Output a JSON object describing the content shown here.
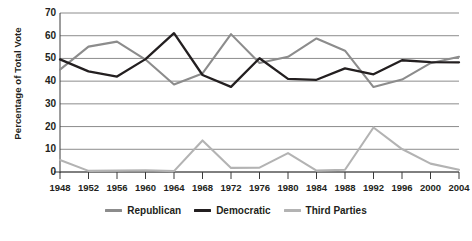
{
  "chart_data": {
    "type": "line",
    "title": "",
    "xlabel": "",
    "ylabel": "Percentage of Total Vote",
    "ylim": [
      0,
      70
    ],
    "yticks": [
      0,
      10,
      20,
      30,
      40,
      50,
      60,
      70
    ],
    "grid": true,
    "legend_position": "bottom",
    "categories": [
      "1948",
      "1952",
      "1956",
      "1960",
      "1964",
      "1968",
      "1972",
      "1976",
      "1980",
      "1984",
      "1988",
      "1992",
      "1996",
      "2000",
      "2004"
    ],
    "series": [
      {
        "name": "Republican",
        "color": "#8c8c8c",
        "values": [
          45.1,
          55.2,
          57.4,
          49.5,
          38.5,
          43.4,
          60.7,
          48.0,
          50.7,
          58.8,
          53.4,
          37.4,
          40.7,
          47.9,
          50.7
        ]
      },
      {
        "name": "Democratic",
        "color": "#231f20",
        "values": [
          49.6,
          44.3,
          42.0,
          49.7,
          61.1,
          42.7,
          37.5,
          50.1,
          41.0,
          40.6,
          45.6,
          43.0,
          49.2,
          48.4,
          48.3
        ]
      },
      {
        "name": "Third Parties",
        "color": "#b3b3b3",
        "values": [
          5.3,
          0.5,
          0.6,
          0.8,
          0.4,
          13.9,
          1.8,
          1.9,
          8.3,
          0.6,
          1.0,
          19.6,
          10.1,
          3.7,
          1.0
        ]
      }
    ]
  },
  "legend": {
    "items": [
      {
        "label": "Republican",
        "color": "#8c8c8c"
      },
      {
        "label": "Democratic",
        "color": "#231f20"
      },
      {
        "label": "Third Parties",
        "color": "#b3b3b3"
      }
    ]
  },
  "axes": {
    "y_title": "Percentage of Total Vote",
    "y_labels": [
      "70",
      "60",
      "50",
      "40",
      "30",
      "20",
      "10",
      "0"
    ],
    "x_labels": [
      "1948",
      "1952",
      "1956",
      "1960",
      "1964",
      "1968",
      "1972",
      "1976",
      "1980",
      "1984",
      "1988",
      "1992",
      "1996",
      "2000",
      "2004"
    ]
  },
  "colors": {
    "grid": "#6e6e6e",
    "axis": "#3a3a3a",
    "text": "#231f20",
    "background": "#ffffff"
  }
}
